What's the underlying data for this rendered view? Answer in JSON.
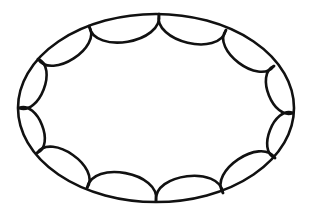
{
  "figure": {
    "background": "#ffffff",
    "stroke_color": "#111111",
    "ellipse": {
      "cx": 156,
      "cy": 108,
      "rx": 138,
      "ry": 94,
      "stroke_width": 2.6
    },
    "scallops": {
      "count": 12,
      "stroke_width": 2.6,
      "bulge": 0.62,
      "vertices": [
        [
          159,
          14
        ],
        [
          226,
          30
        ],
        [
          274,
          66
        ],
        [
          293,
          113
        ],
        [
          275,
          158
        ],
        [
          223,
          193
        ],
        [
          156,
          201
        ],
        [
          87,
          188
        ],
        [
          37,
          153
        ],
        [
          19,
          108
        ],
        [
          38,
          59
        ],
        [
          89,
          26
        ]
      ]
    }
  }
}
